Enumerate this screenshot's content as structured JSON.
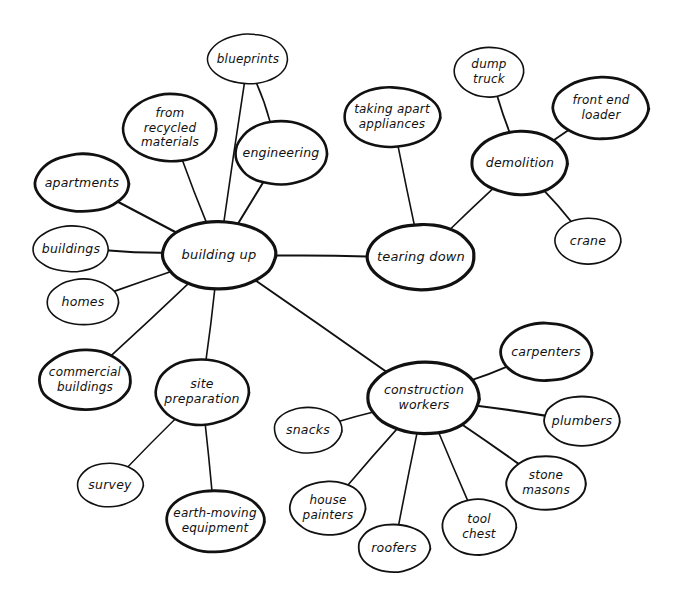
{
  "diagram": {
    "style": "hand-drawn bubble map",
    "background_color": "#ffffff",
    "ink_color": "#111111",
    "width": 679,
    "height": 603,
    "nodes": [
      {
        "id": "building-up",
        "label": "building up",
        "cx": 219,
        "cy": 255,
        "rx": 57,
        "ry": 34,
        "stroke": 3.2,
        "font": 13,
        "lines": [
          "building up"
        ]
      },
      {
        "id": "tearing-down",
        "label": "tearing down",
        "cx": 421,
        "cy": 257,
        "rx": 54,
        "ry": 33,
        "stroke": 3.2,
        "font": 13,
        "lines": [
          "tearing down"
        ]
      },
      {
        "id": "construction-workers",
        "label": "construction workers",
        "cx": 424,
        "cy": 398,
        "rx": 56,
        "ry": 36,
        "stroke": 3.2,
        "font": 12.5,
        "lines": [
          "construction",
          "workers"
        ]
      },
      {
        "id": "demolition",
        "label": "demolition",
        "cx": 520,
        "cy": 163,
        "rx": 48,
        "ry": 32,
        "stroke": 3.0,
        "font": 12.5,
        "lines": [
          "demolition"
        ]
      },
      {
        "id": "site-preparation",
        "label": "site preparation",
        "cx": 202,
        "cy": 392,
        "rx": 47,
        "ry": 33,
        "stroke": 2.6,
        "font": 12.5,
        "lines": [
          "site",
          "preparation"
        ]
      },
      {
        "id": "blueprints",
        "label": "blueprints",
        "cx": 248,
        "cy": 59,
        "rx": 40,
        "ry": 25,
        "stroke": 1.5,
        "font": 12,
        "lines": [
          "blueprints"
        ]
      },
      {
        "id": "from-recycled",
        "label": "from recycled materials",
        "cx": 170,
        "cy": 128,
        "rx": 47,
        "ry": 34,
        "stroke": 2.6,
        "font": 12,
        "lines": [
          "from",
          "recycled",
          "materials"
        ]
      },
      {
        "id": "engineering",
        "label": "engineering",
        "cx": 281,
        "cy": 153,
        "rx": 46,
        "ry": 32,
        "stroke": 2.6,
        "font": 12.5,
        "lines": [
          "engineering"
        ]
      },
      {
        "id": "apartments",
        "label": "apartments",
        "cx": 82,
        "cy": 183,
        "rx": 47,
        "ry": 29,
        "stroke": 2.8,
        "font": 12.5,
        "lines": [
          "apartments"
        ]
      },
      {
        "id": "buildings",
        "label": "buildings",
        "cx": 71,
        "cy": 249,
        "rx": 38,
        "ry": 23,
        "stroke": 1.6,
        "font": 12.5,
        "lines": [
          "buildings"
        ]
      },
      {
        "id": "homes",
        "label": "homes",
        "cx": 83,
        "cy": 302,
        "rx": 36,
        "ry": 23,
        "stroke": 1.6,
        "font": 12.5,
        "lines": [
          "homes"
        ]
      },
      {
        "id": "commercial-buildings",
        "label": "commercial buildings",
        "cx": 85,
        "cy": 380,
        "rx": 46,
        "ry": 30,
        "stroke": 2.8,
        "font": 12,
        "lines": [
          "commercial",
          "buildings"
        ]
      },
      {
        "id": "survey",
        "label": "survey",
        "cx": 110,
        "cy": 485,
        "rx": 33,
        "ry": 22,
        "stroke": 1.6,
        "font": 12.5,
        "lines": [
          "survey"
        ]
      },
      {
        "id": "earth-moving",
        "label": "earth-moving equipment",
        "cx": 215,
        "cy": 521,
        "rx": 49,
        "ry": 31,
        "stroke": 2.8,
        "font": 12,
        "lines": [
          "earth-moving",
          "equipment"
        ]
      },
      {
        "id": "taking-apart",
        "label": "taking apart appliances",
        "cx": 392,
        "cy": 117,
        "rx": 48,
        "ry": 30,
        "stroke": 2.6,
        "font": 12,
        "lines": [
          "taking apart",
          "appliances"
        ]
      },
      {
        "id": "dump-truck",
        "label": "dump truck",
        "cx": 489,
        "cy": 72,
        "rx": 35,
        "ry": 25,
        "stroke": 1.6,
        "font": 12,
        "lines": [
          "dump",
          "truck"
        ]
      },
      {
        "id": "front-end-loader",
        "label": "front end loader",
        "cx": 601,
        "cy": 108,
        "rx": 48,
        "ry": 31,
        "stroke": 2.8,
        "font": 12,
        "lines": [
          "front end",
          "loader"
        ]
      },
      {
        "id": "crane",
        "label": "crane",
        "cx": 588,
        "cy": 241,
        "rx": 33,
        "ry": 23,
        "stroke": 1.6,
        "font": 12.5,
        "lines": [
          "crane"
        ]
      },
      {
        "id": "carpenters",
        "label": "carpenters",
        "cx": 546,
        "cy": 352,
        "rx": 46,
        "ry": 29,
        "stroke": 2.8,
        "font": 12.5,
        "lines": [
          "carpenters"
        ]
      },
      {
        "id": "plumbers",
        "label": "plumbers",
        "cx": 582,
        "cy": 421,
        "rx": 38,
        "ry": 25,
        "stroke": 1.8,
        "font": 12.5,
        "lines": [
          "plumbers"
        ]
      },
      {
        "id": "stone-masons",
        "label": "stone masons",
        "cx": 546,
        "cy": 483,
        "rx": 40,
        "ry": 27,
        "stroke": 2.0,
        "font": 12,
        "lines": [
          "stone",
          "masons"
        ]
      },
      {
        "id": "tool-chest",
        "label": "tool chest",
        "cx": 479,
        "cy": 527,
        "rx": 37,
        "ry": 28,
        "stroke": 1.8,
        "font": 12,
        "lines": [
          "tool",
          "chest"
        ]
      },
      {
        "id": "roofers",
        "label": "roofers",
        "cx": 394,
        "cy": 548,
        "rx": 36,
        "ry": 24,
        "stroke": 1.8,
        "font": 12.5,
        "lines": [
          "roofers"
        ]
      },
      {
        "id": "house-painters",
        "label": "house painters",
        "cx": 328,
        "cy": 508,
        "rx": 38,
        "ry": 27,
        "stroke": 1.8,
        "font": 12,
        "lines": [
          "house",
          "painters"
        ]
      },
      {
        "id": "snacks",
        "label": "snacks",
        "cx": 308,
        "cy": 430,
        "rx": 34,
        "ry": 23,
        "stroke": 1.6,
        "font": 12.5,
        "lines": [
          "snacks"
        ]
      }
    ],
    "edges": [
      {
        "from": "building-up",
        "to": "tearing-down",
        "width": 2.0
      },
      {
        "from": "building-up",
        "to": "construction-workers",
        "width": 2.0
      },
      {
        "from": "building-up",
        "to": "blueprints",
        "width": 1.6
      },
      {
        "from": "building-up",
        "to": "from-recycled",
        "width": 1.6
      },
      {
        "from": "building-up",
        "to": "engineering",
        "width": 2.0
      },
      {
        "from": "building-up",
        "to": "apartments",
        "width": 2.2
      },
      {
        "from": "building-up",
        "to": "buildings",
        "width": 2.0
      },
      {
        "from": "building-up",
        "to": "homes",
        "width": 1.8
      },
      {
        "from": "building-up",
        "to": "commercial-buildings",
        "width": 1.6
      },
      {
        "from": "building-up",
        "to": "site-preparation",
        "width": 1.6
      },
      {
        "from": "engineering",
        "to": "blueprints",
        "width": 1.6
      },
      {
        "from": "site-preparation",
        "to": "survey",
        "width": 1.4
      },
      {
        "from": "site-preparation",
        "to": "earth-moving",
        "width": 1.6
      },
      {
        "from": "tearing-down",
        "to": "taking-apart",
        "width": 1.6
      },
      {
        "from": "tearing-down",
        "to": "demolition",
        "width": 1.6
      },
      {
        "from": "demolition",
        "to": "dump-truck",
        "width": 1.8
      },
      {
        "from": "demolition",
        "to": "front-end-loader",
        "width": 1.8
      },
      {
        "from": "demolition",
        "to": "crane",
        "width": 1.8
      },
      {
        "from": "construction-workers",
        "to": "carpenters",
        "width": 1.8
      },
      {
        "from": "construction-workers",
        "to": "plumbers",
        "width": 2.2
      },
      {
        "from": "construction-workers",
        "to": "stone-masons",
        "width": 2.0
      },
      {
        "from": "construction-workers",
        "to": "tool-chest",
        "width": 1.6
      },
      {
        "from": "construction-workers",
        "to": "roofers",
        "width": 1.6
      },
      {
        "from": "construction-workers",
        "to": "house-painters",
        "width": 1.6
      },
      {
        "from": "construction-workers",
        "to": "snacks",
        "width": 1.6
      }
    ]
  }
}
